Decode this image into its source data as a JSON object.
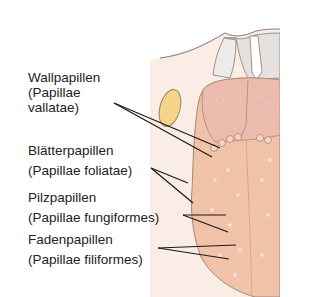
{
  "diagram": {
    "labels": [
      {
        "name": "Wallpapillen",
        "latin_line1": "(Papillae",
        "latin_line2": "vallatae)"
      },
      {
        "name": "Blätterpapillen",
        "latin": "(Papillae foliatae)"
      },
      {
        "name": "Pilzpapillen",
        "latin": "(Papillae fungiformes)"
      },
      {
        "name": "Fadenpapillen",
        "latin": "(Papillae filiformes)"
      }
    ],
    "colors": {
      "tongue": "#f0c2a8",
      "tongue_back": "#f2cbb6",
      "tonsil": "#f3d48a",
      "throat": "#e9e3e0",
      "leader_line": "#1a1a1a"
    }
  }
}
